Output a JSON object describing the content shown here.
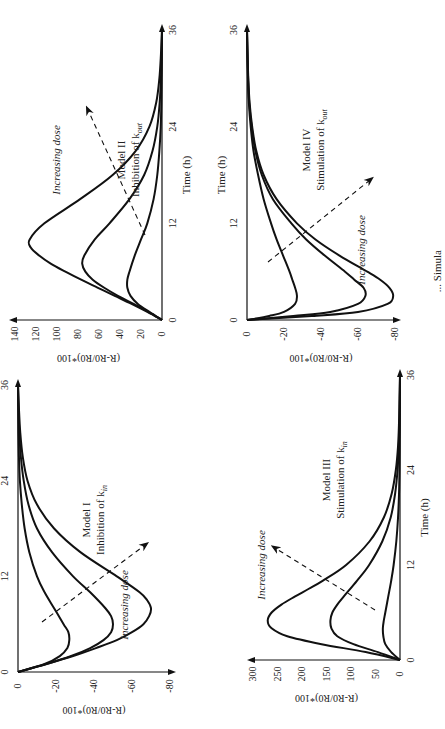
{
  "figure": {
    "caption_fragment": "... Simula"
  },
  "chart_data": [
    {
      "id": "model-1",
      "type": "line",
      "title": "Model I",
      "subtitle": "Inhibition of k_in",
      "subtitle_main": "Inhibition of k",
      "subtitle_sub": "in",
      "xlabel": "Time (h)",
      "ylabel": "(R-R0/R0)*100",
      "x_ticks": [
        0,
        12,
        24,
        36
      ],
      "y_ticks": [
        0,
        -20,
        -40,
        -60,
        -80
      ],
      "xlim": [
        0,
        36
      ],
      "ylim": [
        -80,
        0
      ],
      "annotation": "Increasing dose",
      "series": [
        {
          "name": "low dose",
          "x": [
            0,
            1,
            2,
            3,
            4,
            5,
            6,
            8,
            10,
            12,
            15,
            18,
            21,
            24,
            27,
            30,
            33,
            36
          ],
          "values": [
            0,
            -14,
            -22,
            -26,
            -27,
            -26.5,
            -24,
            -19,
            -14,
            -10,
            -6,
            -3.5,
            -2,
            -1,
            -0.5,
            -0.2,
            -0.1,
            0
          ]
        },
        {
          "name": "mid dose",
          "x": [
            0,
            1,
            2,
            3,
            4,
            5,
            6,
            7,
            8,
            10,
            12,
            15,
            18,
            21,
            24,
            27,
            30,
            33,
            36
          ],
          "values": [
            0,
            -15,
            -28,
            -38,
            -45,
            -49,
            -50,
            -49,
            -46,
            -38,
            -29,
            -18,
            -10,
            -5.5,
            -3,
            -1.5,
            -0.7,
            -0.3,
            0
          ]
        },
        {
          "name": "high dose",
          "x": [
            0,
            1,
            2,
            3,
            4,
            5,
            6,
            7,
            8,
            9,
            10,
            12,
            15,
            18,
            21,
            24,
            27,
            30,
            33,
            36
          ],
          "values": [
            0,
            -15,
            -29,
            -41,
            -52,
            -60,
            -66,
            -69,
            -70,
            -68,
            -64,
            -52,
            -33,
            -19,
            -10,
            -5,
            -2.5,
            -1.2,
            -0.5,
            0
          ]
        }
      ]
    },
    {
      "id": "model-2",
      "type": "line",
      "title": "Model II",
      "subtitle": "Inhibition of k_out",
      "subtitle_main": "Inhibition of k",
      "subtitle_sub": "out",
      "xlabel": "Time (h)",
      "ylabel": "(R-R0/R0)*100",
      "x_ticks": [
        0,
        12,
        24,
        36
      ],
      "y_ticks": [
        0,
        20,
        40,
        60,
        80,
        100,
        120,
        140
      ],
      "xlim": [
        0,
        36
      ],
      "ylim": [
        0,
        140
      ],
      "annotation": "Increasing dose",
      "series": [
        {
          "name": "low dose",
          "x": [
            0,
            1,
            2,
            3,
            4,
            5,
            6,
            8,
            10,
            12,
            15,
            18,
            21,
            24,
            27,
            30,
            33,
            36
          ],
          "values": [
            0,
            12,
            23,
            30,
            33,
            33,
            31,
            26,
            20,
            14,
            8,
            4.5,
            2.5,
            1.2,
            0.6,
            0.3,
            0.1,
            0
          ]
        },
        {
          "name": "mid dose",
          "x": [
            0,
            1,
            2,
            3,
            4,
            5,
            6,
            7,
            8,
            10,
            12,
            15,
            18,
            21,
            24,
            27,
            30,
            33,
            36
          ],
          "values": [
            0,
            13,
            27,
            42,
            55,
            66,
            73,
            76,
            74,
            64,
            50,
            31,
            17,
            9,
            4.5,
            2.2,
            1,
            0.4,
            0
          ]
        },
        {
          "name": "high dose",
          "x": [
            0,
            1,
            2,
            3,
            4,
            5,
            6,
            7,
            8,
            9,
            10,
            12,
            15,
            18,
            21,
            24,
            27,
            30,
            33,
            36
          ],
          "values": [
            0,
            14,
            29,
            45,
            61,
            77,
            92,
            106,
            117,
            125,
            126,
            112,
            78,
            47,
            25,
            12,
            5.5,
            2.5,
            1,
            0
          ]
        }
      ]
    },
    {
      "id": "model-3",
      "type": "line",
      "title": "Model III",
      "subtitle": "Stimulation of k_in",
      "subtitle_main": "Stimulation of k",
      "subtitle_sub": "in",
      "xlabel": "Time (h)",
      "ylabel": "(R-R0/R0)*100",
      "x_ticks": [
        0,
        12,
        24,
        36
      ],
      "y_ticks": [
        0,
        50,
        100,
        150,
        200,
        250,
        300
      ],
      "xlim": [
        0,
        36
      ],
      "ylim": [
        0,
        300
      ],
      "annotation": "Increasing dose",
      "series": [
        {
          "name": "low dose",
          "x": [
            0,
            1,
            2,
            3,
            4,
            5,
            6,
            8,
            10,
            12,
            15,
            18,
            21,
            24,
            27,
            30,
            33,
            36
          ],
          "values": [
            0,
            18,
            30,
            34,
            35,
            33,
            30,
            24,
            18,
            13,
            7.5,
            4,
            2,
            1,
            0.5,
            0.2,
            0.1,
            0
          ]
        },
        {
          "name": "mid dose",
          "x": [
            0,
            1,
            2,
            3,
            4,
            5,
            6,
            7,
            8,
            10,
            12,
            15,
            18,
            21,
            24,
            27,
            30,
            33,
            36
          ],
          "values": [
            0,
            45,
            95,
            128,
            140,
            142,
            138,
            128,
            115,
            88,
            63,
            36,
            19,
            10,
            5,
            2.5,
            1.2,
            0.5,
            0
          ]
        },
        {
          "name": "high dose",
          "x": [
            0,
            1,
            2,
            3,
            4,
            5,
            6,
            7,
            8,
            9,
            10,
            12,
            15,
            18,
            21,
            24,
            27,
            30,
            33,
            36
          ],
          "values": [
            0,
            70,
            160,
            230,
            262,
            270,
            262,
            242,
            215,
            186,
            158,
            110,
            62,
            33,
            17,
            8.5,
            4,
            2,
            1,
            0
          ]
        }
      ]
    },
    {
      "id": "model-4",
      "type": "line",
      "title": "Model IV",
      "subtitle": "Stimulation of k_out",
      "subtitle_main": "Stimulation of k",
      "subtitle_sub": "out",
      "xlabel": "Time (h)",
      "ylabel": "(R-R0/R0)*100",
      "x_ticks": [
        0,
        12,
        24,
        36
      ],
      "y_ticks": [
        0,
        -20,
        -40,
        -60,
        -80
      ],
      "xlim": [
        0,
        36
      ],
      "ylim": [
        -80,
        0
      ],
      "annotation": "Increasing dose",
      "series": [
        {
          "name": "low dose",
          "x": [
            0,
            0.5,
            1,
            2,
            3,
            4,
            5,
            6,
            8,
            10,
            12,
            15,
            18,
            21,
            24,
            27,
            30,
            33,
            36
          ],
          "values": [
            0,
            -12,
            -20,
            -26,
            -27,
            -26,
            -24.5,
            -23,
            -19.5,
            -16,
            -13,
            -9,
            -6,
            -3.5,
            -2,
            -1,
            -0.5,
            -0.2,
            0
          ]
        },
        {
          "name": "mid dose",
          "x": [
            0,
            0.5,
            1,
            2,
            3,
            4,
            5,
            6,
            8,
            10,
            12,
            15,
            18,
            21,
            24,
            27,
            30,
            33,
            36
          ],
          "values": [
            0,
            -25,
            -45,
            -60,
            -64,
            -63,
            -58,
            -53,
            -42,
            -32,
            -24,
            -14,
            -8,
            -4.5,
            -2.5,
            -1.2,
            -0.6,
            -0.3,
            0
          ]
        },
        {
          "name": "high dose",
          "x": [
            0,
            0.5,
            1,
            2,
            3,
            4,
            5,
            6,
            8,
            10,
            12,
            15,
            18,
            21,
            24,
            27,
            30,
            33,
            36
          ],
          "values": [
            0,
            -35,
            -60,
            -76,
            -79,
            -77,
            -72,
            -65,
            -50,
            -37,
            -27,
            -16,
            -9,
            -5,
            -2.8,
            -1.4,
            -0.7,
            -0.3,
            0
          ]
        }
      ]
    }
  ]
}
